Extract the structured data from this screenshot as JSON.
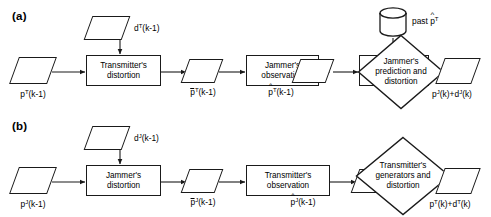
{
  "figure": {
    "type": "flowchart",
    "orientation": "horizontal",
    "panels": 2,
    "stroke_color": "#1a1a1a",
    "fill_color": "#ffffff",
    "background": "#ffffff"
  },
  "panel_a": {
    "label": "(a)",
    "input": {
      "text": "p",
      "sup1": "T",
      "rest": "(k-1)"
    },
    "disturbance": {
      "text": "d",
      "sup1": "T",
      "rest": "(k-1)"
    },
    "store_label": {
      "prefix": "past ",
      "symbol": "p",
      "sup": "T"
    },
    "steps": [
      {
        "name": "transmitters-distortion",
        "line1": "Transmitter's",
        "line2": "distortion"
      },
      {
        "name": "jammers-observation",
        "line1": "Jammer's",
        "line2": "observation"
      },
      {
        "name": "jammers-learner",
        "line1": "Jammer's",
        "line2": "learner"
      }
    ],
    "decision": {
      "line1": "Jammer's",
      "line2": "prediction and",
      "line3": "distortion"
    },
    "signal_1": {
      "base": "p",
      "sup": "T",
      "rest": "(k-1)",
      "accent": "bar"
    },
    "signal_2": {
      "base": "p",
      "sup": "T",
      "rest": "(k-1)",
      "accent": "hat"
    },
    "output": {
      "a_base": "p",
      "a_sup": "J",
      "a_rest": "(k)",
      "plus": "+",
      "b_base": "d",
      "b_sup": "J",
      "b_rest": "(k)"
    }
  },
  "panel_b": {
    "label": "(b)",
    "input": {
      "text": "p",
      "sup1": "J",
      "rest": "(k-1)"
    },
    "disturbance": {
      "text": "d",
      "sup1": "J",
      "rest": "(k-1)"
    },
    "steps": [
      {
        "name": "jammers-distortion",
        "line1": "Jammer's",
        "line2": "distortion"
      },
      {
        "name": "transmitters-observation",
        "line1": "Transmitter's",
        "line2": "observation"
      }
    ],
    "decision": {
      "line1": "Transmitter's",
      "line2": "generators and",
      "line3": "distortion"
    },
    "signal_1": {
      "base": "p",
      "sup": "J",
      "rest": "(k-1)",
      "accent": "bar"
    },
    "signal_2": {
      "base": "p",
      "sup": "J",
      "rest": "(k-1)",
      "accent": "hat"
    },
    "output": {
      "a_base": "p",
      "a_sup": "T",
      "a_rest": "(k)",
      "plus": "+",
      "b_base": "d",
      "b_sup": "T",
      "b_rest": "(k)"
    }
  }
}
